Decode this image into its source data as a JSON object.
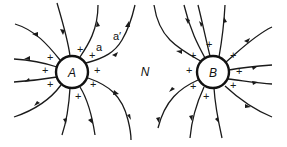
{
  "diagram": {
    "spheres": [
      {
        "label": "A",
        "cx": 72,
        "cy": 72,
        "r": 16,
        "charge_sign": "+"
      },
      {
        "label": "B",
        "cx": 213,
        "cy": 72,
        "r": 16,
        "charge_sign": "+"
      }
    ],
    "neutral_point_label": "N",
    "point_labels": {
      "a": "a",
      "a_prime": "a′"
    },
    "charge_symbol": "+",
    "colors": {
      "line": "#1a1a1a",
      "background": "#ffffff"
    }
  }
}
